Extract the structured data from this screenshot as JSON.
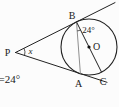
{
  "figure": {
    "labels": {
      "p": "P",
      "b": "B",
      "o": "O",
      "a": "A",
      "c": "C"
    },
    "angles": {
      "at_p": "x",
      "at_b": "24°",
      "corner_note": "=24°"
    },
    "colors": {
      "line": "#222222",
      "chord": "#8f8f8f",
      "text": "#1a1a1a",
      "background": "#fcfcfc"
    }
  }
}
